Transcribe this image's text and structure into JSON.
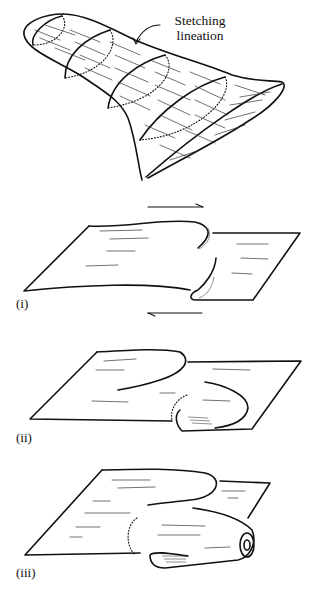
{
  "figure": {
    "annotation": {
      "line1": "Stetching",
      "line2": "lineation"
    },
    "panels": [
      {
        "id": "i",
        "label": "(i)"
      },
      {
        "id": "ii",
        "label": "(ii)"
      },
      {
        "id": "iii",
        "label": "(iii)"
      }
    ],
    "shear_arrows": {
      "top": "right",
      "bottom": "left"
    },
    "colors": {
      "ink": "#111111",
      "background": "#ffffff"
    }
  }
}
